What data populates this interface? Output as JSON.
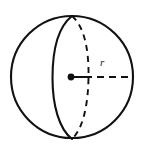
{
  "figure": {
    "name": "sphere-with-radius",
    "caption": "",
    "background_color": "#ffffff",
    "stroke_color": "#111111"
  },
  "geometry": {
    "outline_circle": {
      "center_x": 72,
      "center_y": 77,
      "radius": 61,
      "style": "solid",
      "stroke_width": 2.1
    },
    "great_circle_front_arc": {
      "style": "solid",
      "stroke_width": 2.1,
      "from_x": 72,
      "from_y": 16,
      "to_x": 72,
      "to_y": 139,
      "bulge_x": 52,
      "description": "left-bulging solid half of the equatorial great circle"
    },
    "great_circle_back_arc": {
      "style": "dashed",
      "stroke_width": 1.9,
      "dash_pattern": "6 5",
      "from_x": 72,
      "from_y": 16,
      "to_x": 72,
      "to_y": 139,
      "bulge_x": 88,
      "description": "right-bulging dashed half of the equatorial great circle"
    },
    "center_point": {
      "x": 71,
      "y": 77,
      "dot_radius": 3.4,
      "style": "filled"
    },
    "radius_segment": {
      "from_x": 71,
      "from_y": 77,
      "to_x": 133,
      "to_y": 77,
      "style": "dashed",
      "solid_lead_length": 14,
      "stroke_width": 1.9,
      "dash_pattern": "7 5"
    }
  },
  "labels": {
    "radius": {
      "text": "r",
      "x": 100,
      "y": 57,
      "style": "italic"
    }
  }
}
